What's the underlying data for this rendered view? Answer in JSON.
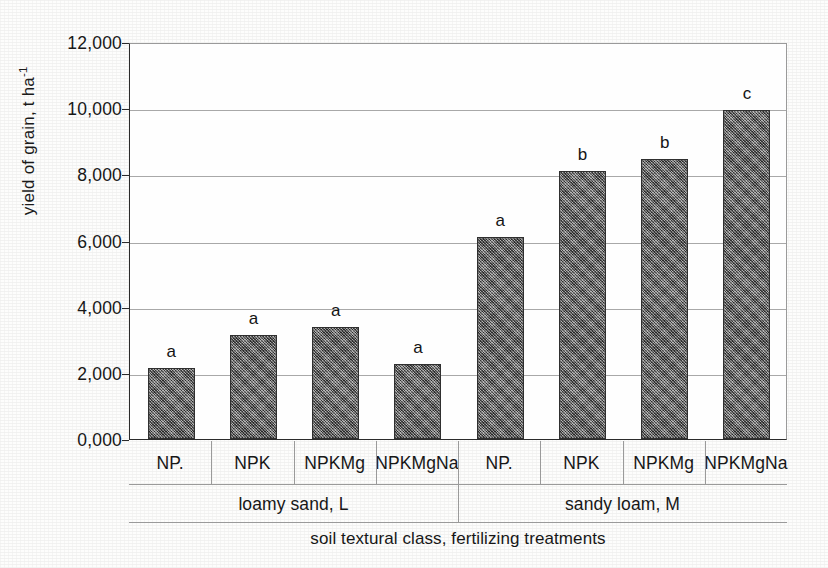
{
  "chart_data": {
    "type": "bar",
    "title": "",
    "xlabel": "soil textural class, fertilizing treatments",
    "ylabel": "yield of grain, t ha-1",
    "ylabel_parts": {
      "main": "yield of grain, t ha",
      "exponent": "-1"
    },
    "ylim": [
      0,
      12
    ],
    "ytick_labels": [
      "12,000",
      "10,000",
      "8,000",
      "6,000",
      "4,000",
      "2,000",
      "0,000"
    ],
    "ytick_values": [
      12,
      10,
      8,
      6,
      4,
      2,
      0
    ],
    "grid": true,
    "legend": "none",
    "categories": [
      "NP.",
      "NPK",
      "NPKMg",
      "NPKMgNa",
      "NP.",
      "NPK",
      "NPKMg",
      "NPKMgNa"
    ],
    "values": [
      2.15,
      3.15,
      3.38,
      2.28,
      6.1,
      8.1,
      8.47,
      9.95
    ],
    "annotations": [
      "a",
      "a",
      "a",
      "a",
      "a",
      "b",
      "b",
      "c"
    ],
    "groups": [
      {
        "label": "loamy sand, L",
        "start": 0,
        "count": 4
      },
      {
        "label": "sandy loam, M",
        "start": 4,
        "count": 4
      }
    ],
    "bars": [
      {
        "category": "NP.",
        "value": 2.15,
        "letter": "a",
        "group": "loamy sand, L"
      },
      {
        "category": "NPK",
        "value": 3.15,
        "letter": "a",
        "group": "loamy sand, L"
      },
      {
        "category": "NPKMg",
        "value": 3.38,
        "letter": "a",
        "group": "loamy sand, L"
      },
      {
        "category": "NPKMgNa",
        "value": 2.28,
        "letter": "a",
        "group": "loamy sand, L"
      },
      {
        "category": "NP.",
        "value": 6.1,
        "letter": "a",
        "group": "sandy loam, M"
      },
      {
        "category": "NPK",
        "value": 8.1,
        "letter": "b",
        "group": "sandy loam, M"
      },
      {
        "category": "NPKMg",
        "value": 8.47,
        "letter": "b",
        "group": "sandy loam, M"
      },
      {
        "category": "NPKMgNa",
        "value": 9.95,
        "letter": "c",
        "group": "sandy loam, M"
      }
    ],
    "colors": {
      "bar_fill": "#6f6f6f",
      "bar_border": "#2f2f2f",
      "gridline": "#a8a8a8",
      "axis": "#2b2b2b",
      "text": "#171717",
      "background": "#fdfdfc"
    }
  }
}
